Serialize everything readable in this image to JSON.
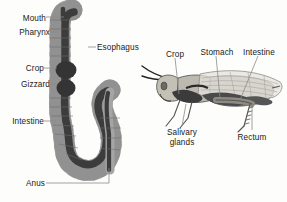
{
  "figure": {
    "background_color": "#fdfdfb",
    "text_color": "#1a1a1a",
    "leader_line_color": "#8a8a8a",
    "gut_outer_color": "#9d9d9d",
    "gut_lumen_color": "#3a3a3a",
    "body_color": "#b8b5ad"
  },
  "left_diagram": {
    "name": "alimentary-canal-detail",
    "labels": [
      {
        "id": "mouth",
        "text": "Mouth",
        "x": 22,
        "y": 14,
        "align": "right"
      },
      {
        "id": "pharynx",
        "text": "Pharynx",
        "x": 13,
        "y": 29,
        "align": "right"
      },
      {
        "id": "esophagus",
        "text": "Esophagus",
        "x": 98,
        "y": 44,
        "align": "left"
      },
      {
        "id": "crop",
        "text": "Crop",
        "x": 28,
        "y": 65,
        "align": "right"
      },
      {
        "id": "gizzard",
        "text": "Gizzard",
        "x": 15,
        "y": 81,
        "align": "right"
      },
      {
        "id": "intestine",
        "text": "Intestine",
        "x": 5,
        "y": 118,
        "align": "right"
      },
      {
        "id": "anus",
        "text": "Anus",
        "x": 26,
        "y": 180,
        "align": "right"
      }
    ]
  },
  "right_diagram": {
    "name": "grasshopper-whole-body",
    "labels": [
      {
        "id": "crop",
        "text": "Crop",
        "x": 173,
        "y": 51,
        "align": "center"
      },
      {
        "id": "stomach",
        "text": "Stomach",
        "x": 216,
        "y": 49,
        "align": "center"
      },
      {
        "id": "intestine",
        "text": "Intestine",
        "x": 258,
        "y": 49,
        "align": "center"
      },
      {
        "id": "salivary-glands",
        "text": "Salivary",
        "x": 182,
        "y": 130,
        "align": "center"
      },
      {
        "id": "salivary-glands-line2",
        "text": "glands",
        "x": 182,
        "y": 140,
        "align": "center"
      },
      {
        "id": "rectum",
        "text": "Rectum",
        "x": 252,
        "y": 134,
        "align": "center"
      }
    ]
  }
}
